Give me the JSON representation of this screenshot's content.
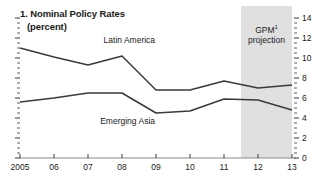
{
  "panel": {
    "title": "1. Nominal Policy Rates",
    "subtitle": "(percent)"
  },
  "annotations": {
    "projection_label_line1": "GPM",
    "projection_label_sup": "1",
    "projection_label_line2": "projection",
    "shade_color": "#e0e0e0",
    "line_color": "#3a3a3a",
    "axis_color": "#8a8a8a"
  },
  "chart_data": {
    "type": "line",
    "title": "1. Nominal Policy Rates",
    "subtitle": "(percent)",
    "xlabel": "",
    "ylabel": "percent",
    "x": [
      2005,
      2006,
      2007,
      2008,
      2009,
      2010,
      2011,
      2012,
      2013
    ],
    "categories": [
      "2005",
      "06",
      "07",
      "08",
      "09",
      "10",
      "11",
      "12",
      "13"
    ],
    "xlim": [
      2005,
      2013
    ],
    "ylim": [
      0,
      14
    ],
    "yticks": [
      0,
      2,
      4,
      6,
      8,
      10,
      12,
      14
    ],
    "ytick_labels": [
      "0",
      "2",
      "4",
      "6",
      "8",
      "10",
      "12",
      "14"
    ],
    "y_axis_position": "right",
    "grid": false,
    "legend": "inline-labels",
    "series": [
      {
        "name": "Latin America",
        "values": [
          11.0,
          10.1,
          9.3,
          10.2,
          6.8,
          6.8,
          7.7,
          7.0,
          7.3
        ],
        "label_x": 2008.4,
        "label_y": 11.7
      },
      {
        "name": "Emerging Asia",
        "values": [
          5.6,
          6.0,
          6.5,
          6.5,
          4.5,
          4.7,
          5.9,
          5.8,
          4.8
        ],
        "label_x": 2008.3,
        "label_y": 3.6
      }
    ],
    "shaded_region": {
      "label": "GPM1 projection",
      "x_start": 2011.5,
      "x_end": 2013
    }
  }
}
